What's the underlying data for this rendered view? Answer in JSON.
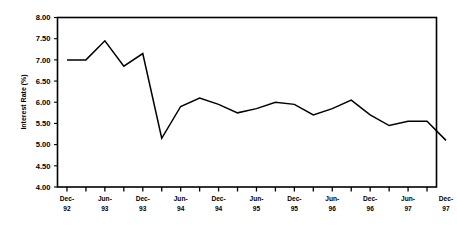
{
  "chart_data": {
    "type": "line",
    "title": "",
    "xlabel": "",
    "ylabel": "Interest Rate (%)",
    "ylim": [
      4.0,
      8.0
    ],
    "ytick_values": [
      4.0,
      4.5,
      5.0,
      5.5,
      6.0,
      6.5,
      7.0,
      7.5,
      8.0
    ],
    "ytick_labels": [
      "4.00",
      "4.50",
      "5.00",
      "5.50",
      "6.00",
      "6.50",
      "7.00",
      "7.50",
      "8.00"
    ],
    "grid": false,
    "legend": "none",
    "x_labeled_ticks": [
      "Dec-\n92",
      "Jun-\n93",
      "Dec-\n93",
      "Jun-\n94",
      "Dec-\n94",
      "Jun-\n95",
      "Dec-\n95",
      "Jun-\n96",
      "Dec-\n96",
      "Jun-\n97",
      "Dec-\n97"
    ],
    "xtick_labels": [
      {
        "line1": "Dec-",
        "line2": "92"
      },
      {
        "line1": "Jun-",
        "line2": "93"
      },
      {
        "line1": "Dec-",
        "line2": "93"
      },
      {
        "line1": "Jun-",
        "line2": "94"
      },
      {
        "line1": "Dec-",
        "line2": "94"
      },
      {
        "line1": "Jun-",
        "line2": "95"
      },
      {
        "line1": "Dec-",
        "line2": "95"
      },
      {
        "line1": "Jun-",
        "line2": "96"
      },
      {
        "line1": "Dec-",
        "line2": "96"
      },
      {
        "line1": "Jun-",
        "line2": "97"
      },
      {
        "line1": "Dec-",
        "line2": "97"
      }
    ],
    "minor_ticks_between_labels": 1,
    "x": [
      "Dec-92",
      "Mar-93",
      "Jun-93",
      "Sep-93",
      "Dec-93",
      "Mar-94",
      "Jun-94",
      "Sep-94",
      "Dec-94",
      "Mar-95",
      "Jun-95",
      "Sep-95",
      "Dec-95",
      "Mar-96",
      "Jun-96",
      "Sep-96",
      "Dec-96",
      "Mar-97",
      "Jun-97",
      "Sep-97",
      "Dec-97"
    ],
    "series": [
      {
        "name": "Interest Rate",
        "values": [
          7.0,
          7.0,
          7.45,
          6.85,
          7.15,
          5.15,
          5.9,
          6.1,
          5.95,
          5.75,
          5.85,
          6.0,
          5.95,
          5.7,
          5.85,
          6.05,
          5.7,
          5.45,
          5.55,
          5.55,
          5.1
        ]
      }
    ],
    "line_color": "#000000",
    "background_color": "#ffffff",
    "axis_color": "#000000"
  }
}
